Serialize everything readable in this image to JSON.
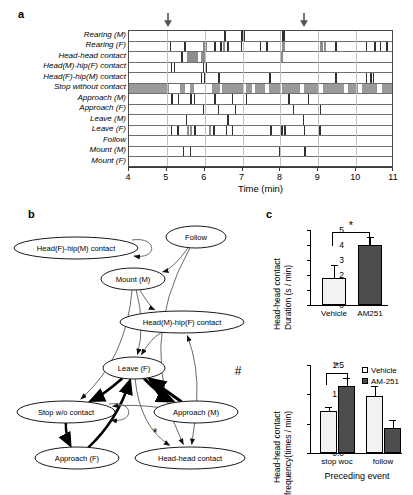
{
  "panels": {
    "a_letter": "a",
    "b_letter": "b",
    "c_letter": "c"
  },
  "ethogram": {
    "xlabel": "Time (min)",
    "x_min": 4,
    "x_max": 11,
    "x_ticks": [
      4,
      5,
      6,
      7,
      8,
      9,
      10,
      11
    ],
    "arrow_positions": [
      5.05,
      8.65
    ],
    "rows": [
      {
        "label": "Rearing (M)",
        "events": [
          [
            6.52,
            0.05
          ],
          [
            6.97,
            0.05
          ],
          [
            7.02,
            0.04
          ],
          [
            8.05,
            0.05
          ],
          [
            8.1,
            0.03
          ]
        ]
      },
      {
        "label": "Rearing (F)",
        "events": [
          [
            5.08,
            0.04
          ],
          [
            5.45,
            0.05
          ],
          [
            5.95,
            0.1
          ],
          [
            6.25,
            0.05
          ],
          [
            6.4,
            0.05
          ],
          [
            6.48,
            0.06
          ],
          [
            6.6,
            0.04
          ],
          [
            6.95,
            0.04
          ],
          [
            7.45,
            0.05
          ],
          [
            7.62,
            0.05
          ],
          [
            8.05,
            0.06
          ],
          [
            9.05,
            0.07
          ],
          [
            9.14,
            0.06
          ],
          [
            9.45,
            0.04
          ],
          [
            10.25,
            0.04
          ],
          [
            10.48,
            0.05
          ],
          [
            10.62,
            0.04
          ],
          [
            10.8,
            0.04
          ]
        ]
      },
      {
        "label": "Head-head contact",
        "events": [
          [
            5.38,
            0.05
          ],
          [
            5.52,
            0.3
          ],
          [
            5.9,
            0.1
          ],
          [
            8.0,
            0.08
          ]
        ]
      },
      {
        "label": "Head(M)-hip(F) contact",
        "events": [
          [
            5.1,
            0.04
          ],
          [
            5.18,
            0.03
          ],
          [
            5.95,
            0.04
          ],
          [
            6.02,
            0.03
          ]
        ]
      },
      {
        "label": "Head(F)-hip(M) contact",
        "events": [
          [
            5.9,
            0.04
          ],
          [
            5.98,
            0.04
          ],
          [
            6.35,
            0.05
          ],
          [
            7.7,
            0.04
          ],
          [
            9.45,
            0.04
          ],
          [
            10.25,
            0.05
          ],
          [
            10.36,
            0.05
          ],
          [
            10.44,
            0.04
          ]
        ]
      },
      {
        "label": "Stop without contact",
        "events": [
          [
            4.0,
            1.05
          ],
          [
            5.35,
            0.12
          ],
          [
            5.62,
            0.1
          ],
          [
            6.18,
            0.22
          ],
          [
            6.45,
            0.55
          ],
          [
            7.08,
            0.18
          ],
          [
            7.32,
            0.28
          ],
          [
            7.7,
            0.3
          ],
          [
            8.05,
            0.48
          ],
          [
            8.62,
            0.4
          ],
          [
            9.12,
            0.55
          ],
          [
            9.78,
            0.28
          ],
          [
            10.15,
            0.4
          ],
          [
            10.68,
            0.28
          ]
        ]
      },
      {
        "label": "Approach (M)",
        "events": [
          [
            5.12,
            0.04
          ],
          [
            5.3,
            0.03
          ],
          [
            5.62,
            0.04
          ],
          [
            5.72,
            0.03
          ],
          [
            6.25,
            0.04
          ],
          [
            6.72,
            0.03
          ],
          [
            7.1,
            0.03
          ],
          [
            7.98,
            0.03
          ],
          [
            8.2,
            0.04
          ],
          [
            8.72,
            0.03
          ]
        ]
      },
      {
        "label": "Approach (F)",
        "events": [
          [
            5.95,
            0.03
          ],
          [
            6.35,
            0.03
          ],
          [
            6.8,
            0.03
          ],
          [
            8.32,
            0.03
          ],
          [
            9.05,
            0.03
          ]
        ]
      },
      {
        "label": "Leave (M)",
        "events": [
          [
            5.5,
            0.03
          ],
          [
            6.6,
            0.03
          ],
          [
            8.6,
            0.03
          ]
        ]
      },
      {
        "label": "Leave (F)",
        "events": [
          [
            5.1,
            0.04
          ],
          [
            5.28,
            0.04
          ],
          [
            5.52,
            0.06
          ],
          [
            5.6,
            0.06
          ],
          [
            5.72,
            0.05
          ],
          [
            6.1,
            0.06
          ],
          [
            6.22,
            0.05
          ],
          [
            6.55,
            0.04
          ],
          [
            6.72,
            0.04
          ],
          [
            7.72,
            0.05
          ],
          [
            8.02,
            0.05
          ],
          [
            8.1,
            0.05
          ],
          [
            8.62,
            0.04
          ],
          [
            9.02,
            0.04
          ]
        ]
      },
      {
        "label": "Follow",
        "events": []
      },
      {
        "label": "Mount (M)",
        "events": [
          [
            5.42,
            0.04
          ],
          [
            5.62,
            0.03
          ],
          [
            7.95,
            0.05
          ],
          [
            8.62,
            0.05
          ]
        ]
      },
      {
        "label": "Mount (F)",
        "events": []
      }
    ]
  },
  "diagram": {
    "nodes": [
      {
        "id": "head_f_hip_m",
        "label": "Head(F)-hip(M) contact",
        "cx": 76,
        "cy": 48,
        "rx": 62,
        "ry": 11
      },
      {
        "id": "follow",
        "label": "Follow",
        "cx": 196,
        "cy": 37,
        "rx": 30,
        "ry": 11
      },
      {
        "id": "mount_m",
        "label": "Mount (M)",
        "cx": 133,
        "cy": 79,
        "rx": 32,
        "ry": 11
      },
      {
        "id": "head_m_hip_f",
        "label": "Head(M)-hip(F) contact",
        "cx": 182,
        "cy": 122,
        "rx": 62,
        "ry": 11
      },
      {
        "id": "leave_f",
        "label": "Leave (F)",
        "cx": 134,
        "cy": 168,
        "rx": 31,
        "ry": 11
      },
      {
        "id": "stop_woc",
        "label": "Stop w/o contact",
        "cx": 66,
        "cy": 212,
        "rx": 49,
        "ry": 11
      },
      {
        "id": "approach_m",
        "label": "Approach (M)",
        "cx": 196,
        "cy": 212,
        "rx": 42,
        "ry": 11
      },
      {
        "id": "approach_f",
        "label": "Approach (F)",
        "cx": 77,
        "cy": 258,
        "rx": 42,
        "ry": 11
      },
      {
        "id": "head_head",
        "label": "Head-head contact",
        "cx": 190,
        "cy": 258,
        "rx": 55,
        "ry": 11
      }
    ],
    "marks": [
      {
        "symbol": "#",
        "x": 238,
        "y": 175
      },
      {
        "symbol": "*",
        "x": 155,
        "y": 237
      }
    ]
  },
  "chart_data": [
    {
      "id": "duration-chart",
      "type": "bar",
      "title": "",
      "ylabel": "Head-head contact\nDuration (s / min)",
      "ylabel_line1": "Head-head contact",
      "ylabel_line2": "Duration (s / min)",
      "xlabel": "",
      "categories": [
        "Vehicle",
        "AM251"
      ],
      "values": [
        1.8,
        4.0
      ],
      "errors": [
        0.85,
        0.55
      ],
      "ylim": [
        0,
        5
      ],
      "yticks": [
        0,
        1,
        2,
        3,
        4,
        5
      ],
      "bar_styles": [
        "open",
        "filled"
      ],
      "annotation": "*",
      "grid": false,
      "legend": "none"
    },
    {
      "id": "frequency-chart",
      "type": "bar",
      "ylabel_line1": "Head-head contact",
      "ylabel_line2": "frequency(times / min)",
      "xlabel": "Preceding event",
      "categories": [
        "stop woc",
        "follow"
      ],
      "series": [
        {
          "name": "Vehicle",
          "values": [
            0.71,
            0.97
          ],
          "errors": [
            0.08,
            0.18
          ],
          "style": "open"
        },
        {
          "name": "AM-251",
          "values": [
            1.14,
            0.42
          ],
          "errors": [
            0.14,
            0.15
          ],
          "style": "filled"
        }
      ],
      "ylim": [
        0,
        1.5
      ],
      "yticks": [
        0.0,
        0.5,
        1.0,
        1.5
      ],
      "ytick_labels": [
        "0.0",
        "0.5",
        "1.0",
        "1.5"
      ],
      "annotation": "*",
      "annotation_group": "stop woc",
      "grid": false,
      "legend": "top-right"
    }
  ],
  "colors": {
    "open_bar": "#f2f2f2",
    "filled_bar": "#4d4d4d",
    "axis": "#000000",
    "grid": "#bfbfbf",
    "stop_band": "#9a9a9a"
  }
}
